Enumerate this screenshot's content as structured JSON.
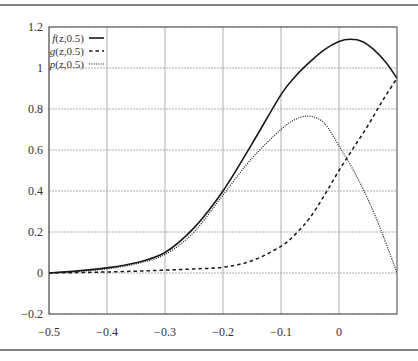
{
  "chart_data": {
    "type": "line",
    "title": "",
    "xlabel": "",
    "ylabel": "",
    "xlim": [
      -0.5,
      0.1
    ],
    "ylim": [
      -0.2,
      1.2
    ],
    "grid": true,
    "legend_position": "upper-left",
    "x_ticks": [
      -0.5,
      -0.4,
      -0.3,
      -0.2,
      -0.1,
      0
    ],
    "x_tick_labels": [
      "−0.5",
      "−0.4",
      "−0.3",
      "−0.2",
      "−0.1",
      "0"
    ],
    "y_ticks": [
      -0.2,
      0,
      0.2,
      0.4,
      0.6,
      0.8,
      1,
      1.2
    ],
    "y_tick_labels": [
      "−0.2",
      "0",
      "0.2",
      "0.4",
      "0.6",
      "0.8",
      "1",
      "1.2"
    ],
    "series": [
      {
        "name": "f(z,0.5)",
        "name_parts": {
          "fn": "f",
          "args": "(z,0.5)"
        },
        "style": "solid",
        "x": [
          -0.5,
          -0.45,
          -0.4,
          -0.35,
          -0.3,
          -0.25,
          -0.2,
          -0.15,
          -0.1,
          -0.075,
          -0.05,
          -0.025,
          0,
          0.02,
          0.04,
          0.06,
          0.08,
          0.1
        ],
        "values": [
          0.0,
          0.01,
          0.025,
          0.05,
          0.1,
          0.22,
          0.4,
          0.63,
          0.87,
          0.96,
          1.03,
          1.09,
          1.13,
          1.14,
          1.13,
          1.09,
          1.03,
          0.95
        ]
      },
      {
        "name": "g(z,0.5)",
        "name_parts": {
          "fn": "g",
          "args": "(z,0.5)"
        },
        "style": "dashed",
        "x": [
          -0.5,
          -0.45,
          -0.4,
          -0.35,
          -0.3,
          -0.25,
          -0.2,
          -0.15,
          -0.1,
          -0.075,
          -0.05,
          -0.025,
          0,
          0.025,
          0.05,
          0.075,
          0.1
        ],
        "values": [
          0.0,
          0.002,
          0.005,
          0.009,
          0.014,
          0.02,
          0.028,
          0.06,
          0.13,
          0.19,
          0.27,
          0.38,
          0.5,
          0.61,
          0.72,
          0.84,
          0.95
        ]
      },
      {
        "name": "p(z,0.5)",
        "name_parts": {
          "fn": "p",
          "args": "(z,0.5)"
        },
        "style": "dotted",
        "x": [
          -0.5,
          -0.45,
          -0.4,
          -0.35,
          -0.3,
          -0.25,
          -0.2,
          -0.15,
          -0.1,
          -0.075,
          -0.05,
          -0.025,
          0,
          0.025,
          0.05,
          0.075,
          0.1
        ],
        "values": [
          0.0,
          0.008,
          0.02,
          0.045,
          0.09,
          0.2,
          0.38,
          0.56,
          0.7,
          0.75,
          0.765,
          0.73,
          0.62,
          0.5,
          0.36,
          0.19,
          0.0
        ]
      }
    ]
  },
  "colors": {
    "axis": "#444444",
    "grid": "#9a9a9a",
    "line": "#1a1a1a",
    "rule": "#555555"
  }
}
